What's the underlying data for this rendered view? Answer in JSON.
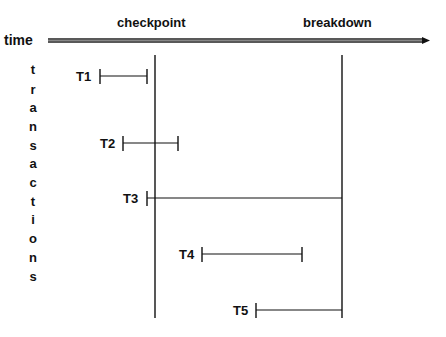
{
  "axis": {
    "time_label": "time",
    "checkpoint_label": "checkpoint",
    "breakdown_label": "breakdown"
  },
  "vertical_label": {
    "text": "transactions",
    "letters": [
      "t",
      "r",
      "a",
      "n",
      "s",
      "a",
      "c",
      "t",
      "i",
      "o",
      "n",
      "s"
    ]
  },
  "transactions": [
    {
      "label": "T1",
      "start_x": 100,
      "end_x": 147,
      "y": 76
    },
    {
      "label": "T2",
      "start_x": 123,
      "end_x": 178,
      "y": 143
    },
    {
      "label": "T3",
      "start_x": 147,
      "end_x": 342,
      "y": 198
    },
    {
      "label": "T4",
      "start_x": 202,
      "end_x": 302,
      "y": 254
    },
    {
      "label": "T5",
      "start_x": 256,
      "end_x": 342,
      "y": 310
    }
  ],
  "markers": {
    "checkpoint_x": 155,
    "breakdown_x": 342
  }
}
